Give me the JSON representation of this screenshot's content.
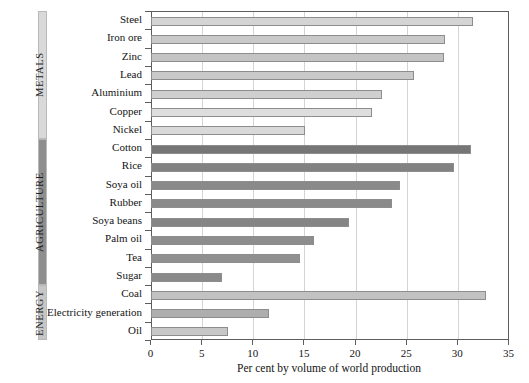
{
  "chart_data": {
    "type": "bar",
    "orientation": "horizontal",
    "title": "",
    "xlabel": "Per cent by volume of world production",
    "ylabel": "",
    "xlim": [
      0,
      35
    ],
    "xticks": [
      0,
      5,
      10,
      15,
      20,
      25,
      30,
      35
    ],
    "xticklabels": [
      "0",
      "5",
      "10",
      "15",
      "20",
      "25",
      "30",
      "35"
    ],
    "grid": "vertical",
    "legend": "none",
    "categories": [
      "Steel",
      "Iron ore",
      "Zinc",
      "Lead",
      "Aluminium",
      "Copper",
      "Nickel",
      "Cotton",
      "Rice",
      "Soya oil",
      "Rubber",
      "Soya beans",
      "Palm oil",
      "Tea",
      "Sugar",
      "Coal",
      "Electricity generation",
      "Oil"
    ],
    "values": [
      31.5,
      28.8,
      28.7,
      25.8,
      22.6,
      21.7,
      15.1,
      31.3,
      29.7,
      24.4,
      23.6,
      19.4,
      16.0,
      14.6,
      7.0,
      32.8,
      11.6,
      7.6
    ],
    "groups": [
      {
        "name": "METALS",
        "categories": [
          "Steel",
          "Iron ore",
          "Zinc",
          "Lead",
          "Aluminium",
          "Copper",
          "Nickel"
        ],
        "color": "#d7d7d7"
      },
      {
        "name": "AGRICULTURE",
        "categories": [
          "Cotton",
          "Rice",
          "Soya oil",
          "Rubber",
          "Soya beans",
          "Palm oil",
          "Tea",
          "Sugar"
        ],
        "color": "#8c8c8c"
      },
      {
        "name": "ENERGY",
        "categories": [
          "Coal",
          "Electricity generation",
          "Oil"
        ],
        "color": "#b9b9b9"
      }
    ],
    "bar_colors": [
      "#d4d4d4",
      "#c9c9c9",
      "#c4c4c4",
      "#c9c9c9",
      "#cfcfcf",
      "#dedede",
      "#d9d9d9",
      "#767676",
      "#828282",
      "#8a8a8a",
      "#8a8a8a",
      "#858585",
      "#8d8d8d",
      "#909090",
      "#8a8a8a",
      "#c2c2c2",
      "#aeaeae",
      "#c7c7c7"
    ]
  },
  "axis": {
    "x_title": "Per cent by volume of world production",
    "tick_labels": [
      "0",
      "5",
      "10",
      "15",
      "20",
      "25",
      "30",
      "35"
    ]
  },
  "sidebar": {
    "groups": [
      {
        "label": "METALS",
        "color": "#d9d9d9"
      },
      {
        "label": "AGRICULTURE",
        "color": "#8e8e8e"
      },
      {
        "label": "ENERGY",
        "color": "#c6c6c6"
      }
    ]
  },
  "colors": {
    "frame": "#5d5d5d",
    "grid": "#d4d4d4",
    "bar_stroke": "#8d8d8d",
    "background": "#ffffff",
    "text": "#141414"
  }
}
